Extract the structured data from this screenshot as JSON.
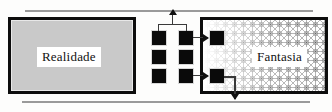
{
  "diagram": {
    "reality": {
      "label": "Realidade",
      "fill_color": "#c9c9c9",
      "border_color": "#0d0d0d"
    },
    "fantasy": {
      "label": "Fantasia",
      "fill_color": "#ffffff",
      "border_color": "#0d0d0d",
      "texture": "crosshatch-star-pattern"
    },
    "middle_grid": {
      "rows": 3,
      "columns": 2,
      "squares": [
        {
          "id": "r1c1",
          "name": "grid-square-row1-col1"
        },
        {
          "id": "r1c2",
          "name": "grid-square-row1-col2"
        },
        {
          "id": "r2c1",
          "name": "grid-square-row2-col1"
        },
        {
          "id": "r2c2",
          "name": "grid-square-row2-col2"
        },
        {
          "id": "r3c1",
          "name": "grid-square-row3-col1"
        },
        {
          "id": "r3c2",
          "name": "grid-square-row3-col2"
        }
      ],
      "square_color": "#0a0a0a"
    },
    "fantasy_squares": [
      {
        "id": "f1",
        "name": "fantasy-square-top"
      },
      {
        "id": "f2",
        "name": "fantasy-square-bottom"
      }
    ],
    "axis_lines": {
      "top": "upper-scale-line",
      "bottom": "lower-scale-line",
      "color": "#9a9a9a"
    },
    "connectors": {
      "bracket": "grid-top-bracket",
      "bracket_arrow": "arrow-up-to-top-line",
      "feed_top": "arrow-right-to-fantasy-top",
      "feed_bottom": "arrow-right-to-fantasy-bottom",
      "return_path": "arrow-down-to-bottom-line",
      "stroke_color": "#3a3a3a",
      "arrow_color": "#111111"
    }
  }
}
